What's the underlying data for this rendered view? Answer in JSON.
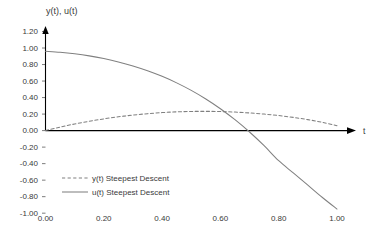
{
  "chart_data": {
    "type": "line",
    "title": "",
    "ylabel": "y(t), u(t)",
    "xlabel": "t",
    "xlim": [
      0.0,
      1.0
    ],
    "ylim": [
      -1.0,
      1.2
    ],
    "grid": false,
    "legend_position": "inside-lower-left",
    "x_ticks": [
      "0.00",
      "0.20",
      "0.40",
      "0.60",
      "0.80",
      "1.00"
    ],
    "x_tick_values": [
      0.0,
      0.2,
      0.4,
      0.6,
      0.8,
      1.0
    ],
    "y_ticks": [
      "1.20",
      "1.00",
      "0.80",
      "0.60",
      "0.40",
      "0.20",
      "0.00",
      "-0.20",
      "-0.40",
      "-0.60",
      "-0.80",
      "-1.00"
    ],
    "y_tick_values": [
      1.2,
      1.0,
      0.8,
      0.6,
      0.4,
      0.2,
      0.0,
      -0.2,
      -0.4,
      -0.6,
      -0.8,
      -1.0
    ],
    "series": [
      {
        "name": "y(t) Steepest Descent",
        "style": "dashed",
        "color": "#808080",
        "x": [
          0.0,
          0.05,
          0.1,
          0.15,
          0.2,
          0.25,
          0.3,
          0.35,
          0.4,
          0.45,
          0.5,
          0.55,
          0.6,
          0.65,
          0.7,
          0.75,
          0.8,
          0.85,
          0.9,
          0.95,
          1.0
        ],
        "values": [
          0.0,
          0.042,
          0.08,
          0.113,
          0.142,
          0.167,
          0.188,
          0.205,
          0.218,
          0.227,
          0.232,
          0.233,
          0.231,
          0.224,
          0.214,
          0.2,
          0.182,
          0.16,
          0.133,
          0.1,
          0.06
        ]
      },
      {
        "name": "u(t) Steepest Descent",
        "style": "solid",
        "color": "#808080",
        "x": [
          0.0,
          0.05,
          0.1,
          0.15,
          0.2,
          0.25,
          0.3,
          0.35,
          0.4,
          0.45,
          0.5,
          0.55,
          0.6,
          0.65,
          0.7,
          0.75,
          0.8,
          0.85,
          0.9,
          0.95,
          1.0
        ],
        "values": [
          0.96,
          0.948,
          0.93,
          0.905,
          0.872,
          0.832,
          0.783,
          0.725,
          0.657,
          0.578,
          0.487,
          0.383,
          0.265,
          0.132,
          -0.017,
          -0.183,
          -0.365,
          -0.512,
          -0.66,
          -0.81,
          -0.95
        ]
      }
    ],
    "legend_entries": [
      {
        "label": "y(t) Steepest Descent",
        "style": "dashed",
        "color": "#808080"
      },
      {
        "label": "u(t) Steepest Descent",
        "style": "solid",
        "color": "#808080"
      }
    ]
  },
  "colors": {
    "axis": "#000000",
    "text": "#3a3a3a",
    "series": "#808080",
    "background": "#ffffff"
  }
}
